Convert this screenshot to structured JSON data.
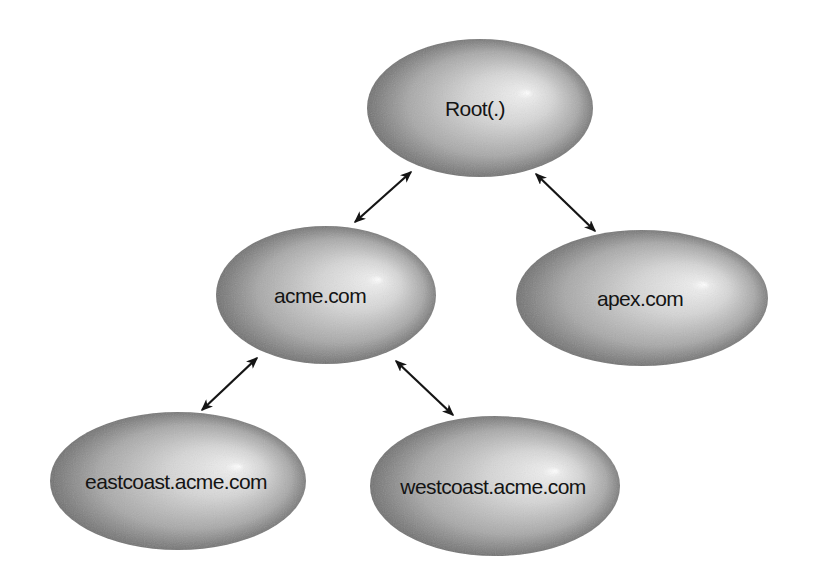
{
  "diagram": {
    "type": "tree",
    "colors": {
      "background": "#ffffff",
      "node_light": "#d6d6d6",
      "node_mid": "#a8a8a8",
      "node_dark": "#6a6a6a",
      "highlight": "#ffffff",
      "arrow": "#151515",
      "text": "#141414"
    },
    "nodes": [
      {
        "id": "root",
        "label": "Root(.)",
        "cx": 480,
        "cy": 108,
        "rx": 113,
        "ry": 69,
        "hx": 528,
        "hy": 83,
        "text_x": 475,
        "text_y": 116
      },
      {
        "id": "acme",
        "label": "acme.com",
        "cx": 326,
        "cy": 295,
        "rx": 110,
        "ry": 69,
        "hx": 379,
        "hy": 270,
        "text_x": 320,
        "text_y": 303
      },
      {
        "id": "apex",
        "label": "apex.com",
        "cx": 642,
        "cy": 298,
        "rx": 126,
        "ry": 68,
        "hx": 705,
        "hy": 273,
        "text_x": 640,
        "text_y": 306
      },
      {
        "id": "eastcoast",
        "label": "eastcoast.acme.com",
        "cx": 178,
        "cy": 481,
        "rx": 128,
        "ry": 69,
        "hx": 239,
        "hy": 454,
        "text_x": 176,
        "text_y": 489
      },
      {
        "id": "westcoast",
        "label": "westcoast.acme.com",
        "cx": 495,
        "cy": 486,
        "rx": 125,
        "ry": 70,
        "hx": 556,
        "hy": 459,
        "text_x": 493,
        "text_y": 494
      }
    ],
    "edges": [
      {
        "from": "root",
        "to": "acme",
        "bidirectional": true,
        "x1": 411,
        "y1": 172,
        "x2": 355,
        "y2": 222
      },
      {
        "from": "root",
        "to": "apex",
        "bidirectional": true,
        "x1": 536,
        "y1": 174,
        "x2": 595,
        "y2": 231
      },
      {
        "from": "acme",
        "to": "eastcoast",
        "bidirectional": true,
        "x1": 257,
        "y1": 358,
        "x2": 202,
        "y2": 410
      },
      {
        "from": "acme",
        "to": "westcoast",
        "bidirectional": true,
        "x1": 396,
        "y1": 361,
        "x2": 453,
        "y2": 415
      }
    ]
  }
}
